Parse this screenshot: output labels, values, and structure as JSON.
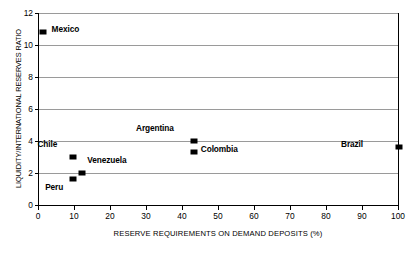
{
  "chart_data": {
    "type": "scatter",
    "title": "",
    "xlabel": "RESERVE REQUIREMENTS ON DEMAND DEPOSITS (%)",
    "ylabel": "LIQUIDITY/INTERNATIONAL RESERVES RATIO",
    "xlim": [
      0,
      100
    ],
    "ylim": [
      0,
      12
    ],
    "xticks": [
      0,
      10,
      20,
      30,
      40,
      50,
      60,
      70,
      80,
      90,
      100
    ],
    "yticks": [
      0,
      2,
      4,
      6,
      8,
      10,
      12
    ],
    "grid": "horizontal",
    "legend": "none",
    "marker_color": "#000000",
    "gridline_color": "#9a9a9a",
    "points": [
      {
        "name": "Mexico",
        "x": 1,
        "y": 10.8,
        "label_dx": 9,
        "label_dy": -4
      },
      {
        "name": "Argentina",
        "x": 43,
        "y": 4.0,
        "label_dx": -20,
        "label_dy": -14
      },
      {
        "name": "Brazil",
        "x": 100,
        "y": 3.6,
        "label_dx": -36,
        "label_dy": -4
      },
      {
        "name": "Colombia",
        "x": 43,
        "y": 3.3,
        "label_dx": 7,
        "label_dy": -4
      },
      {
        "name": "Chile",
        "x": 9.5,
        "y": 3.0,
        "label_dx": -16,
        "label_dy": -14
      },
      {
        "name": "Venezuela",
        "x": 12,
        "y": 2.0,
        "label_dx": 5,
        "label_dy": -14
      },
      {
        "name": "Peru",
        "x": 9.5,
        "y": 1.6,
        "label_dx": -10,
        "label_dy": 7
      }
    ]
  }
}
